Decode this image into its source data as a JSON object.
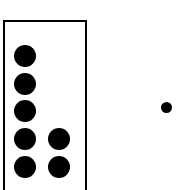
{
  "diagram": {
    "canvas": {
      "width": 178,
      "height": 190,
      "background": "#ffffff"
    },
    "colors": {
      "dot_fill": "#000000",
      "box_stroke": "#000000",
      "box_fill": "#ffffff"
    },
    "group_box": {
      "label": "group-rectangle",
      "x": 3,
      "y": 20,
      "width": 84,
      "height": 172,
      "border_width": 2,
      "note": "bottom edge cropped by image boundary"
    },
    "grouped_dots": {
      "count": 7,
      "diameter": 22,
      "columns": [
        {
          "name": "left-column",
          "count": 5,
          "center_x": 24.5,
          "dots": [
            {
              "index": 1,
              "cx": 24.5,
              "cy": 56
            },
            {
              "index": 2,
              "cx": 24.5,
              "cy": 84
            },
            {
              "index": 3,
              "cx": 24.5,
              "cy": 111
            },
            {
              "index": 4,
              "cx": 24.5,
              "cy": 139
            },
            {
              "index": 5,
              "cx": 24.5,
              "cy": 167
            }
          ]
        },
        {
          "name": "right-column",
          "count": 2,
          "center_x": 59,
          "dots": [
            {
              "index": 1,
              "cx": 59,
              "cy": 139
            },
            {
              "index": 2,
              "cx": 59,
              "cy": 167
            }
          ]
        }
      ]
    },
    "outside_dot": {
      "label": "single-dot-outside-group",
      "count": 1,
      "diameter": 11,
      "cx": 166.5,
      "cy": 107.5
    }
  }
}
